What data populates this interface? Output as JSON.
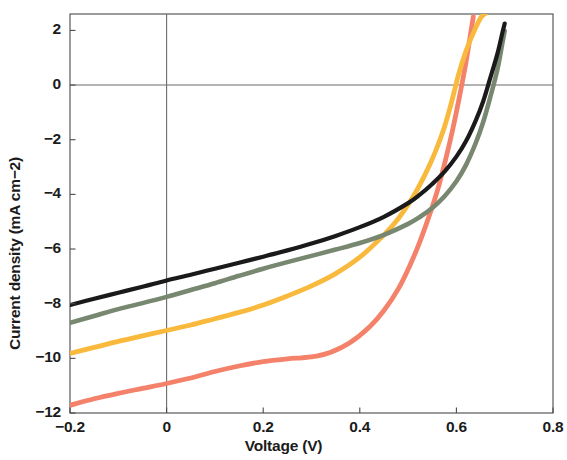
{
  "figure": {
    "background_color": "#ffffff",
    "frame_color": "#4a4a4a"
  },
  "chart_data": {
    "type": "line",
    "title": "",
    "subtitle": "",
    "xlabel": "Voltage (V)",
    "ylabel": "Current density (mA cm−2)",
    "xlim": [
      -0.2,
      0.8
    ],
    "ylim": [
      -12.0,
      2.6
    ],
    "xticks": [
      -0.2,
      0,
      0.2,
      0.4,
      0.6,
      0.8
    ],
    "xticklabels": [
      "−0.2",
      "0",
      "0.2",
      "0.4",
      "0.6",
      "0.8"
    ],
    "yticks": [
      2,
      0,
      -2,
      -4,
      -6,
      -8,
      -10,
      -12
    ],
    "yticklabels": [
      "2",
      "0",
      "−2",
      "−4",
      "−6",
      "−8",
      "−10",
      "−12"
    ],
    "grid": false,
    "zero_lines": {
      "horizontal_y": 0,
      "vertical_x": 0
    },
    "legend": {
      "visible": false,
      "position": "none"
    },
    "annotations": [],
    "series": [
      {
        "name": "black",
        "color": "#1a1a1a",
        "linewidth": 4.2,
        "x": [
          -0.2,
          -0.15,
          -0.1,
          -0.05,
          0.0,
          0.05,
          0.1,
          0.15,
          0.2,
          0.25,
          0.3,
          0.35,
          0.4,
          0.45,
          0.5,
          0.525,
          0.55,
          0.575,
          0.6,
          0.62,
          0.64,
          0.655,
          0.67,
          0.685,
          0.695,
          0.7
        ],
        "y": [
          -8.05,
          -7.82,
          -7.6,
          -7.38,
          -7.15,
          -6.94,
          -6.72,
          -6.5,
          -6.28,
          -6.05,
          -5.8,
          -5.52,
          -5.2,
          -4.82,
          -4.32,
          -4.0,
          -3.62,
          -3.18,
          -2.62,
          -2.05,
          -1.3,
          -0.62,
          0.25,
          1.15,
          1.9,
          2.25
        ]
      },
      {
        "name": "gray-green",
        "color": "#78876f",
        "linewidth": 4.6,
        "x": [
          -0.2,
          -0.15,
          -0.1,
          -0.05,
          0.0,
          0.05,
          0.1,
          0.15,
          0.2,
          0.25,
          0.3,
          0.35,
          0.4,
          0.45,
          0.5,
          0.525,
          0.55,
          0.575,
          0.6,
          0.62,
          0.64,
          0.655,
          0.67,
          0.685,
          0.695,
          0.7
        ],
        "y": [
          -8.7,
          -8.45,
          -8.2,
          -7.98,
          -7.75,
          -7.5,
          -7.25,
          -6.98,
          -6.72,
          -6.48,
          -6.25,
          -6.02,
          -5.78,
          -5.48,
          -5.08,
          -4.82,
          -4.5,
          -4.08,
          -3.52,
          -2.92,
          -2.12,
          -1.38,
          -0.45,
          0.58,
          1.52,
          1.98
        ]
      },
      {
        "name": "amber",
        "color": "#f9b93c",
        "linewidth": 4.8,
        "x": [
          -0.2,
          -0.15,
          -0.1,
          -0.05,
          0.0,
          0.05,
          0.1,
          0.15,
          0.2,
          0.25,
          0.3,
          0.35,
          0.4,
          0.45,
          0.48,
          0.51,
          0.535,
          0.555,
          0.575,
          0.59,
          0.605,
          0.62,
          0.635,
          0.65,
          0.66
        ],
        "y": [
          -9.82,
          -9.6,
          -9.38,
          -9.18,
          -8.98,
          -8.78,
          -8.55,
          -8.32,
          -8.05,
          -7.72,
          -7.35,
          -6.9,
          -6.3,
          -5.48,
          -4.88,
          -4.1,
          -3.28,
          -2.5,
          -1.55,
          -0.62,
          0.42,
          1.25,
          1.9,
          2.45,
          2.62
        ]
      },
      {
        "name": "salmon",
        "color": "#f4816a",
        "linewidth": 4.8,
        "x": [
          -0.2,
          -0.15,
          -0.1,
          -0.05,
          0.0,
          0.05,
          0.1,
          0.15,
          0.2,
          0.25,
          0.28,
          0.31,
          0.34,
          0.38,
          0.42,
          0.45,
          0.48,
          0.505,
          0.525,
          0.545,
          0.562,
          0.578,
          0.592,
          0.605,
          0.62,
          0.635
        ],
        "y": [
          -11.72,
          -11.48,
          -11.28,
          -11.1,
          -10.92,
          -10.72,
          -10.48,
          -10.28,
          -10.12,
          -10.02,
          -9.98,
          -9.92,
          -9.78,
          -9.42,
          -8.85,
          -8.25,
          -7.45,
          -6.55,
          -5.7,
          -4.72,
          -3.78,
          -2.7,
          -1.65,
          -0.55,
          0.85,
          2.5
        ]
      }
    ]
  }
}
